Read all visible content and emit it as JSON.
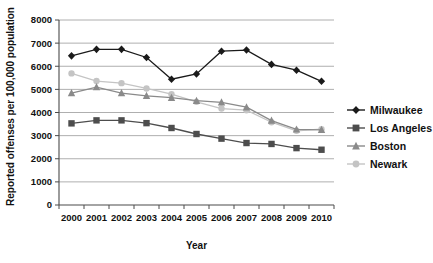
{
  "chart_data": {
    "type": "line",
    "title": "",
    "xlabel": "Year",
    "ylabel": "Reported offenses per 100,000 population",
    "categories": [
      2000,
      2001,
      2002,
      2003,
      2004,
      2005,
      2006,
      2007,
      2008,
      2009,
      2010
    ],
    "x_tick_labels": [
      "2000",
      "2001",
      "2002",
      "2003",
      "2004",
      "2005",
      "2006",
      "2007",
      "2008",
      "2009",
      "2010"
    ],
    "y_tick_labels": [
      "0",
      "1000",
      "2000",
      "3000",
      "4000",
      "5000",
      "6000",
      "7000",
      "8000"
    ],
    "y_ticks": [
      0,
      1000,
      2000,
      3000,
      4000,
      5000,
      6000,
      7000,
      8000
    ],
    "ylim": [
      0,
      8000
    ],
    "grid": "horizontal",
    "legend_position": "right",
    "series": [
      {
        "name": "Milwaukee",
        "marker": "diamond",
        "color": "#1a1a1a",
        "values": [
          6450,
          6730,
          6730,
          6380,
          5440,
          5670,
          6650,
          6700,
          6080,
          5830,
          5350
        ]
      },
      {
        "name": "Los Angeles",
        "marker": "square",
        "color": "#4d4d4d",
        "values": [
          3530,
          3660,
          3660,
          3540,
          3330,
          3070,
          2870,
          2680,
          2640,
          2460,
          2390
        ]
      },
      {
        "name": "Boston",
        "marker": "triangle",
        "color": "#8a8a8a",
        "values": [
          4840,
          5100,
          4840,
          4720,
          4640,
          4510,
          4440,
          4230,
          3650,
          3270,
          3250
        ]
      },
      {
        "name": "Newark",
        "marker": "circle",
        "color": "#c4c4c4",
        "values": [
          5690,
          5360,
          5270,
          5040,
          4790,
          4460,
          4170,
          4100,
          3580,
          3210,
          3280
        ]
      }
    ]
  }
}
